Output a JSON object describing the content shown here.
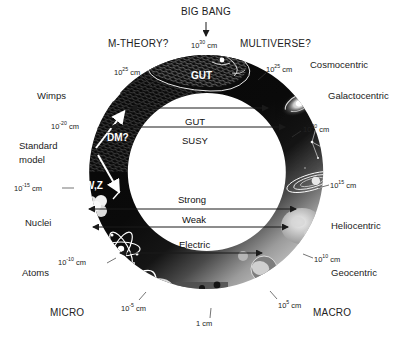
{
  "figure": {
    "type": "cosmic-uroboros-diagram",
    "background": "#ffffff",
    "ring_color": "#0a0a0a",
    "ring_light_color": "#b9b9b9",
    "text_color": "#222222",
    "ring_text_color": "#ffffff"
  },
  "top": {
    "big_bang": "BIG BANG",
    "big_bang_scale": {
      "mantissa": "10",
      "exponent": "30",
      "unit": "cm"
    },
    "arrow": "down-arrow"
  },
  "outer_labels": {
    "left": [
      {
        "name": "m-theory",
        "text": "M-THEORY?"
      },
      {
        "name": "wimps",
        "text": "Wimps"
      },
      {
        "name": "standard-model-line1",
        "text": "Standard"
      },
      {
        "name": "standard-model-line2",
        "text": "model"
      },
      {
        "name": "nuclei",
        "text": "Nuclei"
      },
      {
        "name": "atoms",
        "text": "Atoms"
      },
      {
        "name": "micro",
        "text": "MICRO"
      }
    ],
    "right": [
      {
        "name": "multiverse",
        "text": "MULTIVERSE?"
      },
      {
        "name": "cosmocentric",
        "text": "Cosmocentric"
      },
      {
        "name": "galactocentric",
        "text": "Galactocentric"
      },
      {
        "name": "heliocentric",
        "text": "Heliocentric"
      },
      {
        "name": "geocentric",
        "text": "Geocentric"
      },
      {
        "name": "macro",
        "text": "MACRO"
      }
    ]
  },
  "scale_ticks": [
    {
      "name": "scale-10e30",
      "mantissa": "10",
      "exponent": "30",
      "unit": "cm",
      "side": "top"
    },
    {
      "name": "scale-10e25-left",
      "mantissa": "10",
      "exponent": "25",
      "unit": "cm",
      "side": "left"
    },
    {
      "name": "scale-10e25-right",
      "mantissa": "10",
      "exponent": "25",
      "unit": "cm",
      "side": "right"
    },
    {
      "name": "scale-10e-20",
      "mantissa": "10",
      "exponent": "-20",
      "unit": "cm",
      "side": "left"
    },
    {
      "name": "scale-10e20",
      "mantissa": "10",
      "exponent": "20",
      "unit": "cm",
      "side": "right"
    },
    {
      "name": "scale-10e-15",
      "mantissa": "10",
      "exponent": "-15",
      "unit": "cm",
      "side": "left"
    },
    {
      "name": "scale-10e15",
      "mantissa": "10",
      "exponent": "15",
      "unit": "cm",
      "side": "right"
    },
    {
      "name": "scale-10e-10",
      "mantissa": "10",
      "exponent": "-10",
      "unit": "cm",
      "side": "left"
    },
    {
      "name": "scale-10e10",
      "mantissa": "10",
      "exponent": "10",
      "unit": "cm",
      "side": "right"
    },
    {
      "name": "scale-10e-5",
      "mantissa": "10",
      "exponent": "-5",
      "unit": "cm",
      "side": "bottom-left"
    },
    {
      "name": "scale-10e5",
      "mantissa": "10",
      "exponent": "5",
      "unit": "cm",
      "side": "bottom-right"
    },
    {
      "name": "scale-1cm",
      "mantissa": "1",
      "exponent": "",
      "unit": "cm",
      "side": "bottom"
    }
  ],
  "ring_labels": [
    {
      "name": "gut-on-ring",
      "text": "GUT"
    },
    {
      "name": "dm-question",
      "text": "DM?"
    },
    {
      "name": "wz-bosons",
      "text": "W,Z"
    }
  ],
  "interaction_arrows": [
    {
      "name": "arrow-gut",
      "label": "GUT"
    },
    {
      "name": "arrow-susy",
      "label": "SUSY"
    },
    {
      "name": "arrow-strong",
      "label": "Strong"
    },
    {
      "name": "arrow-weak",
      "label": "Weak"
    },
    {
      "name": "arrow-electric",
      "label": "Electric"
    }
  ],
  "ring_imagery": [
    {
      "name": "snake-head-icon",
      "desc": "snake head (GUT / big bang end)"
    },
    {
      "name": "snake-tail-icon",
      "desc": "snake tail at 1 cm human scale"
    },
    {
      "name": "galaxy-spiral-icon",
      "desc": "spiral galaxy"
    },
    {
      "name": "constellation-icon",
      "desc": "star constellation"
    },
    {
      "name": "saturn-icon",
      "desc": "ringed planet / solar system"
    },
    {
      "name": "sun-icon",
      "desc": "sun surface"
    },
    {
      "name": "earth-icon",
      "desc": "earth globe"
    },
    {
      "name": "atom-icon",
      "desc": "atom with orbiting electrons"
    },
    {
      "name": "nucleus-icon",
      "desc": "nucleus / quark cluster"
    },
    {
      "name": "cell-icon",
      "desc": "biological cell"
    },
    {
      "name": "dna-icon",
      "desc": "DNA helix"
    },
    {
      "name": "human-figures-icon",
      "desc": "two human figures at 1 cm scale"
    }
  ]
}
